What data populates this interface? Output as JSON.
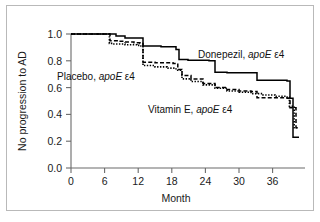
{
  "chart_data": {
    "type": "line",
    "title": "",
    "subtitle": "",
    "xlabel": "Month",
    "ylabel": "No progression to AD",
    "xlim": [
      0,
      39
    ],
    "ylim": [
      0.0,
      1.0
    ],
    "xticks": [
      0,
      6,
      12,
      18,
      24,
      30,
      36
    ],
    "xtick_labels": [
      "0",
      "6",
      "12",
      "18",
      "24",
      "30",
      "36"
    ],
    "yticks": [
      0.0,
      0.2,
      0.4,
      0.6,
      0.8,
      1.0
    ],
    "ytick_labels": [
      "0.0",
      "0.2",
      "0.4",
      "0.6",
      "0.8",
      "1.0"
    ],
    "grid": false,
    "legend_position": "inline-annotations",
    "curve_style": "kaplan-meier step",
    "series": [
      {
        "name": "Donepezil, apoE ε4",
        "label_main": "Donepezil, ",
        "label_italic": "apoE",
        "label_tail": " ε4",
        "style": "solid",
        "color": "#000000",
        "x": [
          0,
          6,
          7.5,
          9,
          11.5,
          12,
          15,
          17.5,
          18,
          19.5,
          23,
          24,
          26,
          30,
          31,
          36,
          36.5,
          37,
          38
        ],
        "y": [
          1.0,
          1.0,
          0.985,
          0.97,
          0.97,
          0.91,
          0.905,
          0.885,
          0.81,
          0.805,
          0.8,
          0.715,
          0.71,
          0.71,
          0.655,
          0.65,
          0.52,
          0.23,
          0.23
        ]
      },
      {
        "name": "Placebo, apoE ε4",
        "label_main": "Placebo, ",
        "label_italic": "apoE",
        "label_tail": " ε4",
        "style": "dashed",
        "color": "#000000",
        "x": [
          0,
          6,
          6.5,
          8,
          9,
          10.5,
          11.5,
          12,
          14,
          17,
          17.8,
          18.5,
          20,
          22,
          24,
          26,
          28,
          30,
          31,
          33,
          36,
          36.5,
          37.5,
          38
        ],
        "y": [
          1.0,
          1.0,
          0.95,
          0.945,
          0.94,
          0.935,
          0.93,
          0.79,
          0.785,
          0.78,
          0.735,
          0.69,
          0.665,
          0.63,
          0.6,
          0.585,
          0.575,
          0.57,
          0.525,
          0.525,
          0.52,
          0.45,
          0.3,
          0.3
        ]
      },
      {
        "name": "Vitamin E, apoE ε4",
        "label_main": "Vitamin E, ",
        "label_italic": "apoE",
        "label_tail": " ε4",
        "style": "dotted",
        "color": "#000000",
        "x": [
          0,
          6,
          6.4,
          7,
          9,
          11,
          11.5,
          12,
          14,
          16,
          17.5,
          18.5,
          20,
          22,
          24,
          26,
          28,
          30,
          32,
          34,
          36,
          36.4,
          37.2,
          38
        ],
        "y": [
          1.0,
          1.0,
          0.93,
          0.925,
          0.92,
          0.915,
          0.91,
          0.765,
          0.755,
          0.745,
          0.73,
          0.665,
          0.645,
          0.62,
          0.595,
          0.575,
          0.565,
          0.555,
          0.545,
          0.535,
          0.53,
          0.46,
          0.3,
          0.3
        ]
      }
    ],
    "annotations": [
      {
        "name": "donepezil-label",
        "text": "Donepezil, apoE ε4",
        "x_px": 198,
        "y_px": 58
      },
      {
        "name": "placebo-label",
        "text": "Placebo, apoE ε4",
        "x_px": 57,
        "y_px": 80
      },
      {
        "name": "vitamin-e-label",
        "text": "Vitamin E, apoE ε4",
        "x_px": 148,
        "y_px": 113
      }
    ]
  },
  "colors": {
    "curve": "#000000",
    "axis": "#6a6a6a",
    "frame": "#b9b9b9",
    "background": "#ffffff",
    "text": "#1a1a1a"
  }
}
